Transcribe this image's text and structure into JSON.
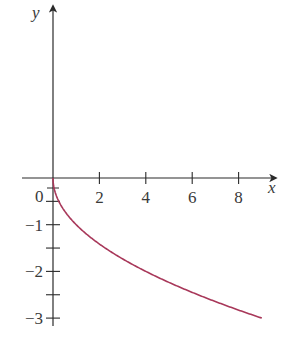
{
  "chart_data": {
    "type": "line",
    "title": "",
    "xlabel": "x",
    "ylabel": "y",
    "function": "y = -sqrt(x)",
    "x_ticks": [
      2,
      4,
      6,
      8
    ],
    "x_tick_labels": [
      "2",
      "4",
      "6",
      "8"
    ],
    "y_ticks": [
      -1,
      -2,
      -3
    ],
    "y_tick_labels": [
      "−1",
      "−2",
      "−3"
    ],
    "y_minor_ticks": [
      -0.5,
      -1.5,
      -2.5
    ],
    "origin_label": "0",
    "xlim": [
      -1.5,
      10
    ],
    "ylim": [
      -3.3,
      3.6
    ],
    "grid": false,
    "legend": null,
    "series": [
      {
        "name": "y = -√x",
        "color": "#a8385a",
        "x": [
          0,
          0.25,
          0.5,
          1,
          2,
          3,
          4,
          5,
          6,
          7,
          8,
          9
        ],
        "y": [
          0,
          -0.5,
          -0.71,
          -1,
          -1.41,
          -1.73,
          -2,
          -2.24,
          -2.45,
          -2.65,
          -2.83,
          -3
        ]
      }
    ]
  },
  "colors": {
    "axis": "#2a2a2a",
    "curve": "#a8385a",
    "text": "#3a3a3a"
  }
}
